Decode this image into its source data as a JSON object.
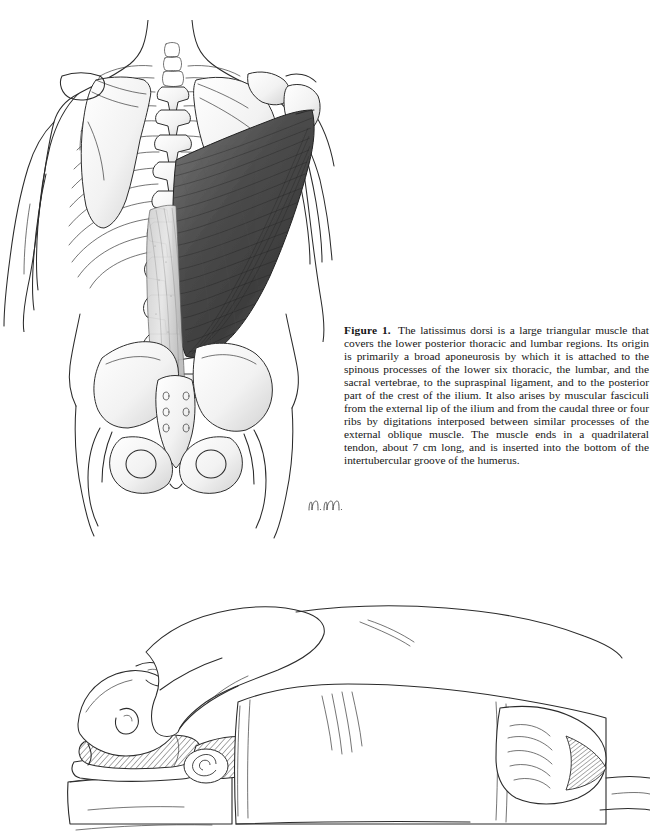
{
  "page": {
    "background_color": "#ffffff",
    "width": 650,
    "height": 831
  },
  "figure_caption": {
    "label": "Figure 1.",
    "body": "The latissimus dorsi is a large triangular muscle that covers the lower posterior thoracic and lumbar regions. Its origin is primarily a broad aponeurosis by which it is attached to the spinous processes of the lower six thoracic, the lumbar, and the sacral vertebrae, to the supraspinal ligament, and to the posterior part of the crest of the ilium. It also arises by muscular fasciculi from the external lip of the ilium and from the caudal three or four ribs by digitations interposed between similar processes of the external oblique muscle. The muscle ends in a quadrilateral tendon, about 7 cm long, and is inserted into the bottom of the intertubercular groove of the humerus."
  },
  "artist_signature": {
    "initials": "n.m.",
    "description": "handwritten artist initials"
  },
  "figures": [
    {
      "name": "posterior-back-anatomy",
      "title": "Posterior view of torso showing latissimus dorsi",
      "structures": [
        "body outline of torso",
        "upper arms",
        "thoracic rib cage",
        "vertebral column",
        "left scapula",
        "right scapula",
        "right humerus",
        "latissimus dorsi muscle",
        "thoracolumbar aponeurosis",
        "pelvis with iliac crests",
        "sacrum",
        "obturator foramina",
        "femoral heads"
      ],
      "shading": {
        "muscle_fill_dark": "#4a4a4a",
        "muscle_fill_light": "#8d8d8d",
        "bone_fill": "#fdfdfd",
        "line_color": "#2b2b2b"
      }
    },
    {
      "name": "patient-prone-positioning",
      "title": "Patient in prone position on operating table with rolled supports",
      "structures": [
        "patient head turned to side",
        "shoulder and upper arm",
        "rolled head support",
        "rolled axillary support",
        "operating table surface",
        "surgical drape over torso",
        "draped lower limb",
        "flexed knee under drape"
      ],
      "shading": {
        "hatch_color": "#2b2b2b",
        "line_color": "#2b2b2b"
      }
    }
  ]
}
